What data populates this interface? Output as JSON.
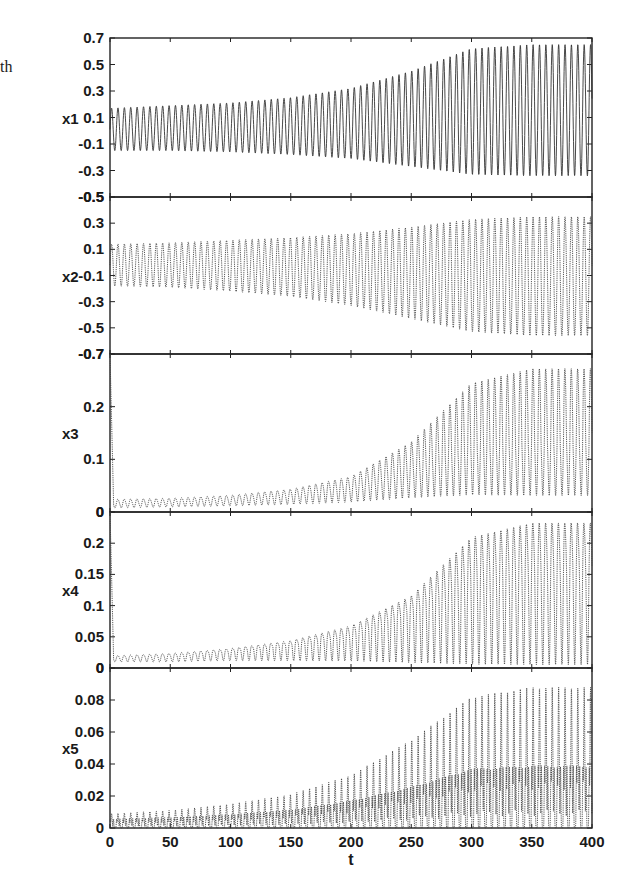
{
  "stray_text": "th",
  "chart_data": [
    {
      "type": "line",
      "name": "x1",
      "ylabel": "x1",
      "xlabel": "",
      "xlim": [
        0,
        400
      ],
      "ylim": [
        -0.5,
        0.7
      ],
      "yticks": [
        "0.7",
        "0.5",
        "0.3",
        "0.1",
        "-0.1",
        "-0.3",
        "-0.5"
      ],
      "ytick_values": [
        0.7,
        0.5,
        0.3,
        0.1,
        -0.1,
        -0.3,
        -0.5
      ],
      "period": 5.3,
      "envelope": {
        "t": [
          0,
          50,
          100,
          150,
          200,
          250,
          300,
          350,
          400
        ],
        "upper": [
          0.17,
          0.19,
          0.21,
          0.25,
          0.32,
          0.45,
          0.62,
          0.65,
          0.65
        ],
        "lower": [
          -0.15,
          -0.15,
          -0.16,
          -0.18,
          -0.21,
          -0.27,
          -0.33,
          -0.34,
          -0.34
        ]
      }
    },
    {
      "type": "line",
      "name": "x2",
      "ylabel": "x2",
      "xlabel": "",
      "xlim": [
        0,
        400
      ],
      "ylim": [
        -0.7,
        0.5
      ],
      "yticks": [
        "0.3",
        "0.1",
        "-0.1",
        "-0.3",
        "-0.5",
        "-0.7"
      ],
      "ytick_values": [
        0.3,
        0.1,
        -0.1,
        -0.3,
        -0.5,
        -0.7
      ],
      "top_label": "-0.5",
      "period": 5.3,
      "envelope": {
        "t": [
          0,
          50,
          100,
          150,
          200,
          250,
          300,
          350,
          400
        ],
        "upper": [
          0.14,
          0.15,
          0.17,
          0.19,
          0.22,
          0.27,
          0.33,
          0.35,
          0.35
        ],
        "lower": [
          -0.18,
          -0.19,
          -0.22,
          -0.26,
          -0.33,
          -0.43,
          -0.53,
          -0.56,
          -0.56
        ]
      }
    },
    {
      "type": "line",
      "name": "x3",
      "ylabel": "x3",
      "xlabel": "",
      "xlim": [
        0,
        400
      ],
      "ylim": [
        0,
        0.3
      ],
      "yticks": [
        "0.2",
        "0.1",
        "0"
      ],
      "ytick_values": [
        0.2,
        0.1,
        0
      ],
      "top_label": "-0.7",
      "initial_spike": 0.3,
      "period": 5.3,
      "envelope": {
        "t": [
          0,
          50,
          100,
          150,
          200,
          250,
          300,
          350,
          400
        ],
        "upper": [
          0.025,
          0.027,
          0.033,
          0.045,
          0.07,
          0.14,
          0.26,
          0.29,
          0.29
        ],
        "lower": [
          0.008,
          0.01,
          0.012,
          0.015,
          0.02,
          0.03,
          0.04,
          0.04,
          0.04
        ],
        "mean": [
          0.015,
          0.018,
          0.022,
          0.03,
          0.045,
          0.075,
          0.11,
          0.115,
          0.115
        ]
      }
    },
    {
      "type": "line",
      "name": "x4",
      "ylabel": "x4",
      "xlabel": "",
      "xlim": [
        0,
        400
      ],
      "ylim": [
        0,
        0.25
      ],
      "yticks": [
        "0.2",
        "0.15",
        "0.1",
        "0.05",
        "0"
      ],
      "ytick_values": [
        0.2,
        0.15,
        0.1,
        0.05,
        0
      ],
      "top_label": "0",
      "initial_spike": 0.25,
      "period": 5.3,
      "envelope": {
        "t": [
          0,
          50,
          100,
          150,
          200,
          250,
          300,
          350,
          400
        ],
        "upper": [
          0.02,
          0.024,
          0.032,
          0.045,
          0.07,
          0.12,
          0.22,
          0.245,
          0.245
        ],
        "lower": [
          0.01,
          0.01,
          0.012,
          0.012,
          0.012,
          0.01,
          0.01,
          0.01,
          0.01
        ],
        "mean": [
          0.015,
          0.018,
          0.025,
          0.035,
          0.05,
          0.085,
          0.13,
          0.14,
          0.14
        ]
      }
    },
    {
      "type": "line",
      "name": "x5",
      "ylabel": "x5",
      "xlabel": "t",
      "xlim": [
        0,
        400
      ],
      "ylim": [
        0,
        0.1
      ],
      "yticks": [
        "0.08",
        "0.06",
        "0.04",
        "0.02",
        "0"
      ],
      "ytick_values": [
        0.08,
        0.06,
        0.04,
        0.02,
        0
      ],
      "top_label": "0",
      "xticks": [
        "0",
        "50",
        "100",
        "150",
        "200",
        "250",
        "300",
        "350",
        "400"
      ],
      "xtick_values": [
        0,
        50,
        100,
        150,
        200,
        250,
        300,
        350,
        400
      ],
      "period": 5.3,
      "envelope": {
        "t": [
          0,
          50,
          100,
          150,
          200,
          250,
          300,
          350,
          400
        ],
        "upper": [
          0.009,
          0.011,
          0.015,
          0.021,
          0.033,
          0.055,
          0.082,
          0.088,
          0.088
        ],
        "secondary": [
          0.006,
          0.007,
          0.009,
          0.012,
          0.018,
          0.027,
          0.039,
          0.041,
          0.041
        ],
        "lower": [
          0,
          0,
          0,
          0,
          0,
          0,
          0,
          0,
          0
        ]
      }
    }
  ]
}
